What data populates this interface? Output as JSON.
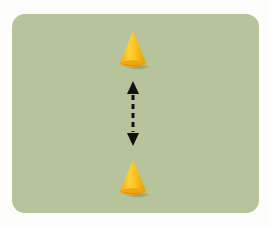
{
  "diagram": {
    "description": "Two cones placed vertically with a dashed double-headed arrow between them",
    "background_color": "#b6c39b",
    "cones": [
      {
        "id": "top-cone",
        "color": "#f5b81c",
        "position": "top"
      },
      {
        "id": "bottom-cone",
        "color": "#f5b81c",
        "position": "bottom"
      }
    ],
    "arrow": {
      "style": "dashed",
      "direction": "bidirectional-vertical",
      "color": "#111111"
    }
  }
}
